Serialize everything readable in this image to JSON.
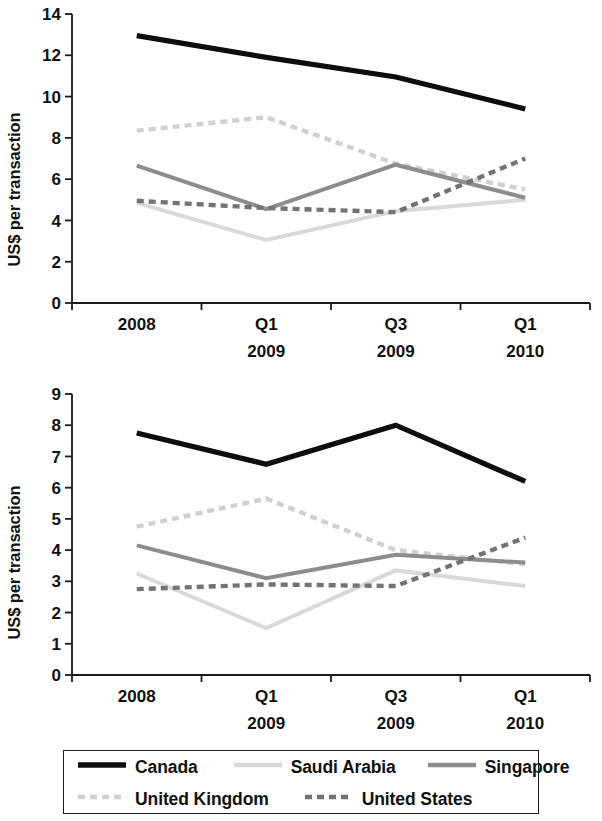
{
  "chart_data": [
    {
      "type": "line",
      "panel": "top",
      "title": "",
      "xlabel": "",
      "ylabel": "US$ per transaction",
      "categories": [
        "2008",
        "Q1 2009",
        "Q3 2009",
        "Q1 2010"
      ],
      "category_lines": [
        [
          "2008",
          ""
        ],
        [
          "Q1",
          "2009"
        ],
        [
          "Q3",
          "2009"
        ],
        [
          "Q1",
          "2010"
        ]
      ],
      "ylim": [
        0,
        14
      ],
      "yticks": [
        0,
        2,
        4,
        6,
        8,
        10,
        12,
        14
      ],
      "grid": false,
      "legend_position": "bottom",
      "series": [
        {
          "name": "Canada",
          "values": [
            12.95,
            11.9,
            10.95,
            9.4
          ]
        },
        {
          "name": "Saudi Arabia",
          "values": [
            4.85,
            3.05,
            4.45,
            5.0
          ]
        },
        {
          "name": "Singapore",
          "values": [
            6.65,
            4.55,
            6.7,
            5.1
          ]
        },
        {
          "name": "United Kingdom",
          "values": [
            8.35,
            9.0,
            6.75,
            5.5
          ]
        },
        {
          "name": "United States",
          "values": [
            4.95,
            4.6,
            4.4,
            7.0
          ]
        }
      ]
    },
    {
      "type": "line",
      "panel": "bottom",
      "title": "",
      "xlabel": "",
      "ylabel": "US$ per transaction",
      "categories": [
        "2008",
        "Q1 2009",
        "Q3 2009",
        "Q1 2010"
      ],
      "category_lines": [
        [
          "2008",
          ""
        ],
        [
          "Q1",
          "2009"
        ],
        [
          "Q3",
          "2009"
        ],
        [
          "Q1",
          "2010"
        ]
      ],
      "ylim": [
        0,
        9
      ],
      "yticks": [
        0,
        1,
        2,
        3,
        4,
        5,
        6,
        7,
        8,
        9
      ],
      "grid": false,
      "legend_position": "bottom",
      "series": [
        {
          "name": "Canada",
          "values": [
            7.75,
            6.75,
            8.0,
            6.2
          ]
        },
        {
          "name": "Saudi Arabia",
          "values": [
            3.25,
            1.5,
            3.35,
            2.85
          ]
        },
        {
          "name": "Singapore",
          "values": [
            4.15,
            3.1,
            3.85,
            3.6
          ]
        },
        {
          "name": "United Kingdom",
          "values": [
            4.75,
            5.65,
            4.0,
            3.55
          ]
        },
        {
          "name": "United States",
          "values": [
            2.75,
            2.9,
            2.85,
            4.4
          ]
        }
      ]
    }
  ],
  "legend": {
    "rows": [
      [
        {
          "label": "Canada",
          "style": "solid",
          "color": "#0d0d0d",
          "width": 5.5
        },
        {
          "label": "Saudi Arabia",
          "style": "solid",
          "color": "#d9d9d9",
          "width": 4.5
        },
        {
          "label": "Singapore",
          "style": "solid",
          "color": "#8c8c8c",
          "width": 4.5
        }
      ],
      [
        {
          "label": "United Kingdom",
          "style": "dashed",
          "color": "#d0d0d0",
          "width": 4.5
        },
        {
          "label": "United States",
          "style": "dashed",
          "color": "#737373",
          "width": 4.5
        }
      ]
    ]
  },
  "colors": {
    "canada": "#0d0d0d",
    "saudi_arabia": "#d9d9d9",
    "singapore": "#8c8c8c",
    "united_kingdom": "#d0d0d0",
    "united_states": "#737373",
    "axis": "#1a1a1a",
    "background": "#ffffff"
  }
}
